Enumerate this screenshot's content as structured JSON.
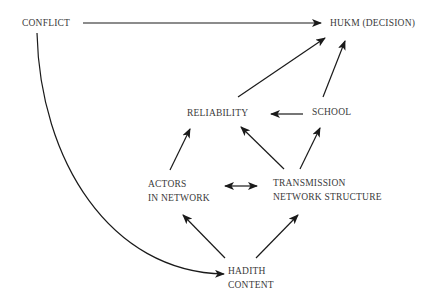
{
  "diagram": {
    "nodes": [
      {
        "id": "conflict",
        "label": "CONFLICT"
      },
      {
        "id": "hukm",
        "label": "HUKM (DECISION)"
      },
      {
        "id": "reliability",
        "label": "RELIABILITY"
      },
      {
        "id": "school",
        "label": "SCHOOL"
      },
      {
        "id": "actors",
        "line1": "ACTORS",
        "line2": "IN NETWORK"
      },
      {
        "id": "transmission",
        "line1": "TRANSMISSION",
        "line2": "NETWORK STRUCTURE"
      },
      {
        "id": "hadith",
        "line1": "HADITH",
        "line2": "CONTENT"
      }
    ],
    "edges": [
      {
        "from": "conflict",
        "to": "hukm"
      },
      {
        "from": "conflict",
        "to": "hadith",
        "style": "curved"
      },
      {
        "from": "reliability",
        "to": "hukm"
      },
      {
        "from": "school",
        "to": "hukm"
      },
      {
        "from": "school",
        "to": "reliability"
      },
      {
        "from": "actors",
        "to": "reliability"
      },
      {
        "from": "transmission",
        "to": "reliability"
      },
      {
        "from": "transmission",
        "to": "school"
      },
      {
        "from": "actors",
        "to": "transmission",
        "style": "bidirectional"
      },
      {
        "from": "hadith",
        "to": "actors"
      },
      {
        "from": "hadith",
        "to": "transmission"
      }
    ],
    "colors": {
      "line": "#1a1a1a",
      "text": "#3a3a3a"
    }
  }
}
